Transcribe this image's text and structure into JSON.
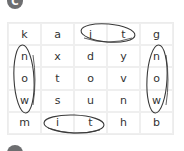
{
  "section_label": "C",
  "grid": {
    "rows": [
      [
        "k",
        "a",
        "i",
        "t",
        "g"
      ],
      [
        "n",
        "x",
        "d",
        "y",
        "n"
      ],
      [
        "o",
        "t",
        "o",
        "v",
        "o"
      ],
      [
        "w",
        "s",
        "u",
        "n",
        "w"
      ],
      [
        "m",
        "i",
        "t",
        "h",
        "b"
      ]
    ]
  },
  "circled_words": [
    {
      "word": "it",
      "cells": [
        [
          0,
          2
        ],
        [
          0,
          3
        ]
      ],
      "direction": "horizontal"
    },
    {
      "word": "now",
      "cells": [
        [
          1,
          0
        ],
        [
          2,
          0
        ],
        [
          3,
          0
        ]
      ],
      "direction": "vertical"
    },
    {
      "word": "now",
      "cells": [
        [
          1,
          4
        ],
        [
          2,
          4
        ],
        [
          3,
          4
        ]
      ],
      "direction": "vertical"
    },
    {
      "word": "it",
      "cells": [
        [
          4,
          1
        ],
        [
          4,
          2
        ]
      ],
      "direction": "horizontal"
    }
  ],
  "colors": {
    "badge": "#6d6e70",
    "ring": "#3a3a3a",
    "grid_line": "#efefef"
  }
}
